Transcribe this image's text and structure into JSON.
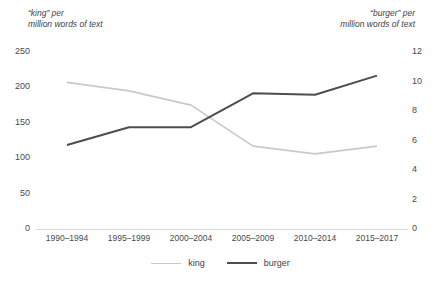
{
  "chart_data": {
    "type": "line",
    "title": "",
    "categories": [
      "1990–1994",
      "1995–1999",
      "2000–2004",
      "2005–2009",
      "2010–2014",
      "2015–2017"
    ],
    "series": [
      {
        "name": "king",
        "axis": "left",
        "color": "#c9c9c9",
        "values": [
          207,
          195,
          175,
          117,
          106,
          117
        ]
      },
      {
        "name": "burger",
        "axis": "right",
        "color": "#4d4d4d",
        "values": [
          5.7,
          6.9,
          6.9,
          9.2,
          9.1,
          10.4
        ]
      }
    ],
    "left_axis": {
      "label": "“king” per\nmillion words of text",
      "ticks": [
        "250",
        "200",
        "150",
        "100",
        "50",
        "0"
      ],
      "tick_values": [
        250,
        200,
        150,
        100,
        50,
        0
      ],
      "ylim": [
        0,
        250
      ]
    },
    "right_axis": {
      "label": "“burger” per\nmillion words of text",
      "ticks": [
        "12",
        "10",
        "8",
        "6",
        "4",
        "2",
        "0"
      ],
      "tick_values": [
        12,
        10,
        8,
        6,
        4,
        2,
        0
      ],
      "ylim": [
        0,
        12
      ]
    },
    "xlabel": "",
    "grid": false,
    "legend_position": "bottom",
    "legend": [
      "king",
      "burger"
    ],
    "background_color": "#ffffff"
  }
}
